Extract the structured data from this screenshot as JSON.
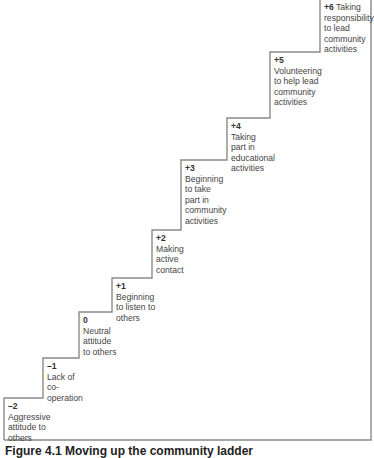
{
  "figure": {
    "caption": "Figure 4.1  Moving up the community ladder",
    "line_color": "#8a8a8a",
    "steps": [
      {
        "level": "–2",
        "text": [
          "Aggressive",
          "attitude to",
          "others"
        ]
      },
      {
        "level": "–1",
        "text": [
          "Lack of",
          "co-",
          "operation"
        ]
      },
      {
        "level": "0",
        "text": [
          "Neutral",
          "attitude",
          "to others"
        ]
      },
      {
        "level": "+1",
        "text": [
          "Beginning",
          "to listen to",
          "others"
        ]
      },
      {
        "level": "+2",
        "text": [
          "Making",
          "active",
          "contact"
        ]
      },
      {
        "level": "+3",
        "text": [
          "Beginning",
          "to take",
          "part in",
          "community",
          "activities"
        ]
      },
      {
        "level": "+4",
        "text": [
          "Taking",
          "part in",
          "educational",
          "activities"
        ]
      },
      {
        "level": "+5",
        "text": [
          "Volunteering",
          "to help lead",
          "community",
          "activities"
        ]
      },
      {
        "level": "+6",
        "text": [
          "Taking",
          "responsibility",
          "to lead",
          "community",
          "activities"
        ]
      }
    ]
  }
}
